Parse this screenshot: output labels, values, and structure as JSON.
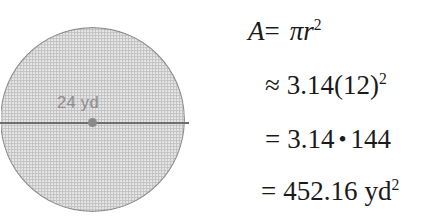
{
  "figure": {
    "shape": "circle",
    "fill_color": "#c9c9c9",
    "stroke_color": "#8f8f8f",
    "line_color": "#6e6e6e",
    "label_color": "#8d8d8d",
    "diameter_label": "24 yd",
    "diameter_value": 24,
    "diameter_unit": "yd",
    "radius_value": 12
  },
  "equations": {
    "line1": {
      "lhs": "A",
      "operator": "=",
      "rhs_pi": "π",
      "rhs_var": "r",
      "rhs_exp": "2"
    },
    "line2": {
      "operator": "≈",
      "value": "3.14(12)",
      "exp": "2"
    },
    "line3": {
      "operator": "=",
      "factor1": "3.14",
      "mult_symbol": "•",
      "factor2": "144"
    },
    "line4": {
      "operator": "=",
      "value": "452.16",
      "unit": "yd",
      "exp": "2"
    }
  }
}
